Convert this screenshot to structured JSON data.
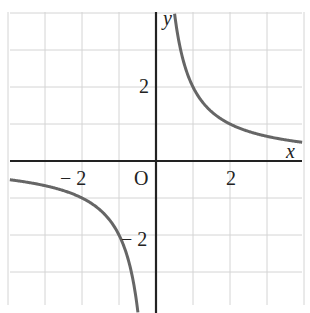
{
  "chart_data": {
    "type": "line",
    "title": "",
    "function": "y = 2/x",
    "xlabel": "x",
    "ylabel": "y",
    "origin_label": "O",
    "xlim": [
      -4,
      4
    ],
    "ylim": [
      -4,
      4
    ],
    "grid": true,
    "x_tick_labels": [
      {
        "value": -2,
        "text": "− 2"
      },
      {
        "value": 2,
        "text": "2"
      }
    ],
    "y_tick_labels": [
      {
        "value": 2,
        "text": "2"
      },
      {
        "value": -2,
        "text": "− 2"
      }
    ],
    "series": [
      {
        "name": "branch-positive",
        "x": [
          0.5,
          1,
          2,
          4
        ],
        "y": [
          4,
          2,
          1,
          0.5
        ]
      },
      {
        "name": "branch-negative",
        "x": [
          -4,
          -2,
          -1,
          -0.5
        ],
        "y": [
          -0.5,
          -1,
          -2,
          -4
        ]
      }
    ],
    "colors": {
      "curve": "#666666",
      "axis": "#222222",
      "grid": "#d4d4d4"
    }
  }
}
